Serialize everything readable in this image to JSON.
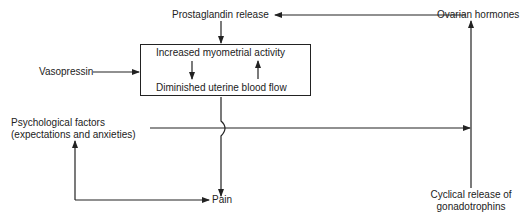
{
  "diagram": {
    "type": "flow-diagram",
    "nodes": {
      "prostaglandin": "Prostaglandin release",
      "ovarian": "Ovarian hormones",
      "vasopressin": "Vasopressin",
      "box_top": "Increased myometrial activity",
      "box_bottom": "Diminished uterine blood flow",
      "psych_line1": "Psychological factors",
      "psych_line2": "(expectations and anxieties)",
      "pain": "Pain",
      "cyclical_line1": "Cyclical release of",
      "cyclical_line2": "gonadotrophins"
    },
    "edges": [
      {
        "from": "Ovarian hormones",
        "to": "Prostaglandin release"
      },
      {
        "from": "Prostaglandin release",
        "to": "Increased myometrial activity"
      },
      {
        "from": "Vasopressin",
        "to": "Increased myometrial activity"
      },
      {
        "from": "Increased myometrial activity",
        "to": "Diminished uterine blood flow"
      },
      {
        "from": "Diminished uterine blood flow",
        "to": "Increased myometrial activity"
      },
      {
        "from": "Diminished uterine blood flow",
        "to": "Pain"
      },
      {
        "from": "Psychological factors",
        "to": "Cyclical release of gonadotrophins"
      },
      {
        "from": "Pain",
        "to": "Psychological factors"
      },
      {
        "from": "Psychological factors",
        "to": "Pain"
      },
      {
        "from": "Cyclical release of gonadotrophins",
        "to": "Ovarian hormones"
      }
    ],
    "colors": {
      "line": "#222222",
      "background": "#ffffff"
    }
  }
}
